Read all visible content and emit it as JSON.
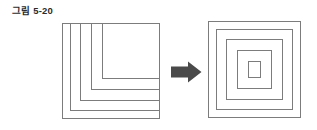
{
  "figure": {
    "caption": "그림 5-20",
    "caption_color": "#2b2b2b",
    "background_color": "#ffffff",
    "stroke_color": "#7c7c7c",
    "arrow_color": "#4a4a4a"
  },
  "left_diagram": {
    "name": "nested-open-brackets",
    "description": "outer square with four nested L-shaped brackets open on the right side",
    "outer_square": {
      "x": 0,
      "y": 0,
      "width": 98,
      "height": 96
    },
    "brackets": [
      {
        "inset": 8,
        "label": "bracket-1"
      },
      {
        "inset": 18,
        "label": "bracket-2"
      },
      {
        "inset": 29,
        "label": "bracket-3"
      },
      {
        "inset": 40,
        "label": "bracket-4"
      }
    ]
  },
  "arrow": {
    "label": "transform-arrow",
    "direction": "right",
    "color": "#4a4a4a",
    "x": 171,
    "y": 61,
    "width": 31,
    "height": 22
  },
  "right_diagram": {
    "name": "concentric-squares",
    "description": "five concentric squares",
    "squares": [
      {
        "inset": 0,
        "label": "square-1-outer"
      },
      {
        "inset": 8,
        "label": "square-2"
      },
      {
        "inset": 18,
        "label": "square-3"
      },
      {
        "inset": 29,
        "label": "square-4"
      },
      {
        "inset": 40,
        "label": "square-5-inner"
      }
    ]
  },
  "chart_data": {
    "type": "diagram",
    "title": "그림 5-20",
    "panels": [
      {
        "name": "before",
        "shape": "nested-open-brackets",
        "ring_count": 5,
        "note": "outer square plus 4 concentric L brackets open to the right"
      },
      {
        "name": "after",
        "shape": "concentric-squares",
        "ring_count": 5,
        "note": "5 fully closed concentric squares"
      }
    ],
    "relation": "arrow-right"
  }
}
